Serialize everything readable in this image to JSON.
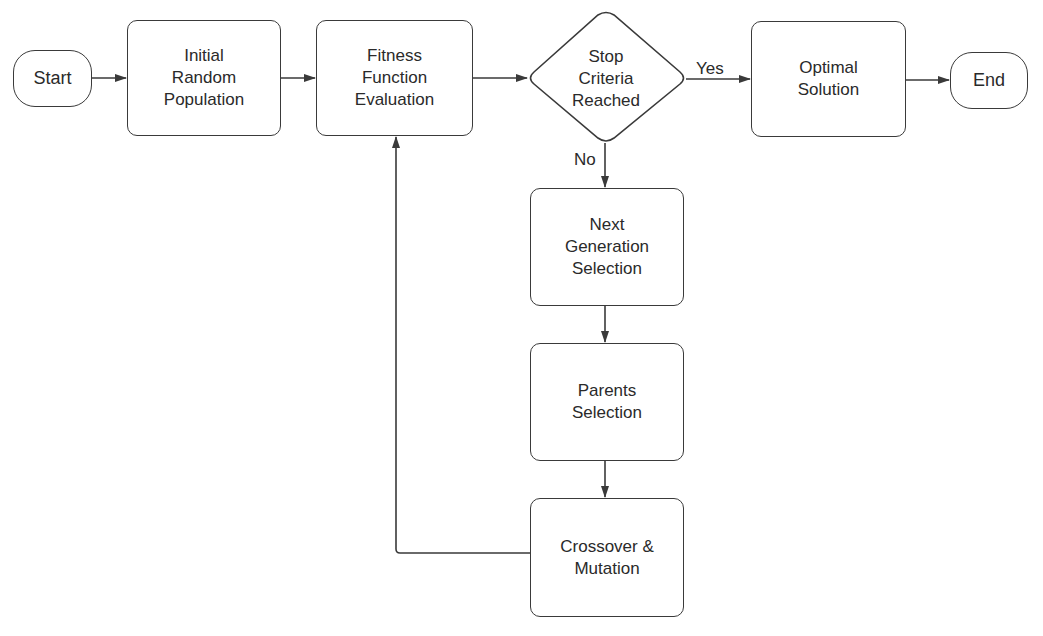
{
  "diagram": {
    "type": "flowchart",
    "nodes": {
      "start": {
        "label": "Start",
        "shape": "terminal"
      },
      "initial_population": {
        "label": "Initial\nRandom\nPopulation",
        "shape": "process"
      },
      "fitness_evaluation": {
        "label": "Fitness\nFunction\nEvaluation",
        "shape": "process"
      },
      "stop_criteria": {
        "label": "Stop\nCriteria\nReached",
        "shape": "decision"
      },
      "optimal_solution": {
        "label": "Optimal\nSolution",
        "shape": "process"
      },
      "end": {
        "label": "End",
        "shape": "terminal"
      },
      "next_generation": {
        "label": "Next\nGeneration\nSelection",
        "shape": "process"
      },
      "parents_selection": {
        "label": "Parents\nSelection",
        "shape": "process"
      },
      "crossover_mutation": {
        "label": "Crossover &\nMutation",
        "shape": "process"
      }
    },
    "edges": [
      {
        "from": "start",
        "to": "initial_population",
        "label": ""
      },
      {
        "from": "initial_population",
        "to": "fitness_evaluation",
        "label": ""
      },
      {
        "from": "fitness_evaluation",
        "to": "stop_criteria",
        "label": ""
      },
      {
        "from": "stop_criteria",
        "to": "optimal_solution",
        "label": "Yes"
      },
      {
        "from": "optimal_solution",
        "to": "end",
        "label": ""
      },
      {
        "from": "stop_criteria",
        "to": "next_generation",
        "label": "No"
      },
      {
        "from": "next_generation",
        "to": "parents_selection",
        "label": ""
      },
      {
        "from": "parents_selection",
        "to": "crossover_mutation",
        "label": ""
      },
      {
        "from": "crossover_mutation",
        "to": "fitness_evaluation",
        "label": ""
      }
    ],
    "edge_labels": {
      "yes": "Yes",
      "no": "No"
    },
    "colors": {
      "stroke": "#3a3a3a",
      "text": "#2a2a2a",
      "background": "#ffffff"
    }
  }
}
